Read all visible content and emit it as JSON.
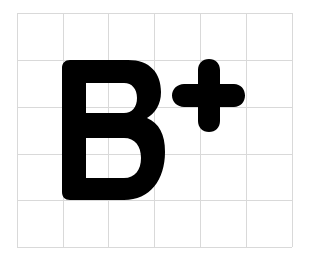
{
  "logo": {
    "text": "B+",
    "letter": "B",
    "symbol": "+",
    "fill_color": "#000000",
    "background_color": "#ffffff"
  },
  "grid": {
    "columns": 6,
    "rows": 5,
    "line_color": "#d9d9d9",
    "x_lines": [
      17,
      63,
      108,
      154,
      200,
      246,
      292
    ],
    "y_lines": [
      13,
      60,
      107,
      154,
      200,
      247
    ]
  }
}
